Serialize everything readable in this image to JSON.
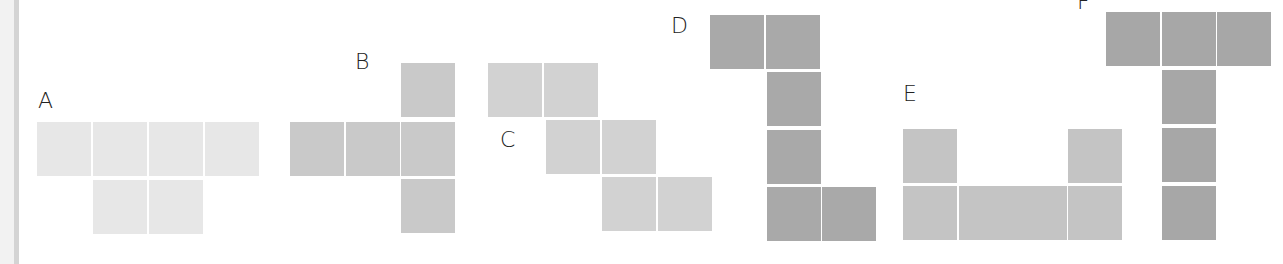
{
  "figures": [
    {
      "label": "A",
      "label_pos": [
        38,
        90
      ],
      "color": "#e7e7e7",
      "squares": [
        [
          37,
          122
        ],
        [
          93,
          122
        ],
        [
          149,
          122
        ],
        [
          205,
          122
        ],
        [
          93,
          180
        ],
        [
          149,
          180
        ]
      ]
    },
    {
      "label": "B",
      "label_pos": [
        355,
        51
      ],
      "color": "#c9c9c9",
      "squares": [
        [
          401,
          63
        ],
        [
          290,
          122
        ],
        [
          346,
          122
        ],
        [
          401,
          122
        ],
        [
          401,
          179
        ]
      ]
    },
    {
      "label": "C",
      "label_pos": [
        500,
        129
      ],
      "color": "#d2d2d2",
      "squares": [
        [
          488,
          63
        ],
        [
          544,
          63
        ],
        [
          546,
          120
        ],
        [
          602,
          120
        ],
        [
          602,
          177
        ],
        [
          658,
          177
        ]
      ]
    },
    {
      "label": "D",
      "label_pos": [
        671,
        15
      ],
      "color": "#a9a9a9",
      "squares": [
        [
          710,
          15
        ],
        [
          766,
          15
        ],
        [
          767,
          72
        ],
        [
          767,
          130
        ],
        [
          767,
          187
        ],
        [
          822,
          187
        ]
      ]
    },
    {
      "label": "E",
      "label_pos": [
        903,
        83
      ],
      "color": "#c4c4c4",
      "squares": [
        [
          903,
          129
        ],
        [
          1068,
          129
        ],
        [
          903,
          186
        ],
        [
          959,
          186
        ],
        [
          1013,
          186
        ],
        [
          1068,
          186
        ]
      ]
    },
    {
      "label": "F",
      "label_pos": [
        1077,
        -9
      ],
      "color": "#a7a7a7",
      "squares": [
        [
          1106,
          12
        ],
        [
          1162,
          12
        ],
        [
          1217,
          12
        ],
        [
          1162,
          70
        ],
        [
          1162,
          128
        ],
        [
          1162,
          186
        ]
      ]
    }
  ],
  "square_size": 54
}
